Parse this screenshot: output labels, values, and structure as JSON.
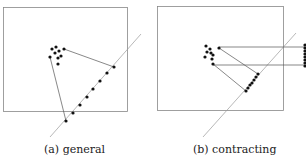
{
  "figure": {
    "panels": [
      {
        "id": "a",
        "caption": "(a) general",
        "box": {
          "x": 3,
          "y": 7,
          "w": 124,
          "h": 104
        },
        "line": {
          "x1": 50,
          "y1": 137,
          "x2": 141,
          "y2": 34
        },
        "cluster": [
          [
            52,
            49
          ],
          [
            56,
            47
          ],
          [
            59,
            51
          ],
          [
            55,
            53
          ],
          [
            50,
            57
          ],
          [
            58,
            58
          ],
          [
            61,
            56
          ],
          [
            58,
            64
          ],
          [
            64,
            49
          ]
        ],
        "line_points": [
          [
            114,
            67
          ],
          [
            107,
            73
          ],
          [
            100,
            81
          ],
          [
            93,
            89
          ],
          [
            87,
            97
          ],
          [
            80,
            105
          ],
          [
            73,
            113
          ],
          [
            66,
            121
          ]
        ],
        "hull_edges": [
          [
            [
              64,
              49
            ],
            [
              114,
              67
            ]
          ],
          [
            [
              50,
              57
            ],
            [
              66,
              121
            ]
          ]
        ]
      },
      {
        "id": "b",
        "caption": "(b) contracting",
        "box": {
          "x": 157,
          "y": 6,
          "w": 126,
          "h": 104
        },
        "line": {
          "x1": 203,
          "y1": 137,
          "x2": 296,
          "y2": 33
        },
        "cluster": [
          [
            206,
            46
          ],
          [
            210,
            49
          ],
          [
            207,
            52
          ],
          [
            211,
            53
          ],
          [
            205,
            57
          ],
          [
            213,
            55
          ],
          [
            212,
            59
          ],
          [
            213,
            64
          ],
          [
            219,
            48
          ]
        ],
        "line_points": [
          [
            258,
            74
          ],
          [
            256,
            77
          ],
          [
            254,
            80
          ],
          [
            252,
            83
          ],
          [
            250,
            85
          ],
          [
            248,
            88
          ],
          [
            246,
            91
          ]
        ],
        "edges": [
          [
            [
              219,
              48
            ],
            [
              258,
              74
            ]
          ],
          [
            [
              213,
              64
            ],
            [
              246,
              91
            ]
          ]
        ],
        "projections": [
          [
            [
              219,
              47
            ],
            [
              305,
              47
            ]
          ],
          [
            [
              213,
              65
            ],
            [
              305,
              65
            ]
          ]
        ],
        "edge_dots_x": 305,
        "edge_dots_y": [
          45,
          48,
          51,
          54,
          57,
          60,
          63,
          66
        ]
      }
    ],
    "colors": {
      "box": "#888888",
      "line": "#999999",
      "dot": "#111111",
      "edge": "#555555"
    }
  }
}
